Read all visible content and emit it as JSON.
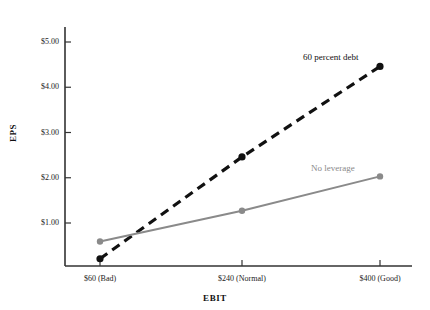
{
  "chart_data": {
    "type": "line",
    "title": "",
    "clipped_top_text": "",
    "xlabel": "EBIT",
    "ylabel": "EPS",
    "categories": [
      "$60 (Bad)",
      "$240 (Normal)",
      "$400 (Good)"
    ],
    "x": [
      60,
      240,
      400
    ],
    "xlim": [
      0,
      445
    ],
    "ylim": [
      0,
      5.3
    ],
    "grid": false,
    "legend_position": "inline-annotations",
    "ytick_labels": [
      "$5.00",
      "$4.00",
      "$3.00",
      "$2.00",
      "$1.00"
    ],
    "ytick_values": [
      5.0,
      4.0,
      3.0,
      2.0,
      1.0
    ],
    "series": [
      {
        "name": "60 percent debt",
        "values": [
          0.21,
          2.46,
          4.46
        ],
        "style": "dashed",
        "color": "#111111",
        "marker": "circle"
      },
      {
        "name": "No leverage",
        "values": [
          0.59,
          1.27,
          2.03
        ],
        "style": "solid",
        "color": "#8a8a8a",
        "marker": "circle"
      }
    ],
    "annotations": [
      {
        "text": "60 percent debt",
        "series": "60 percent debt",
        "color": "#111111"
      },
      {
        "text": "No leverage",
        "series": "No leverage",
        "color": "#8a8a8a"
      }
    ],
    "axis_color": "#333333"
  }
}
